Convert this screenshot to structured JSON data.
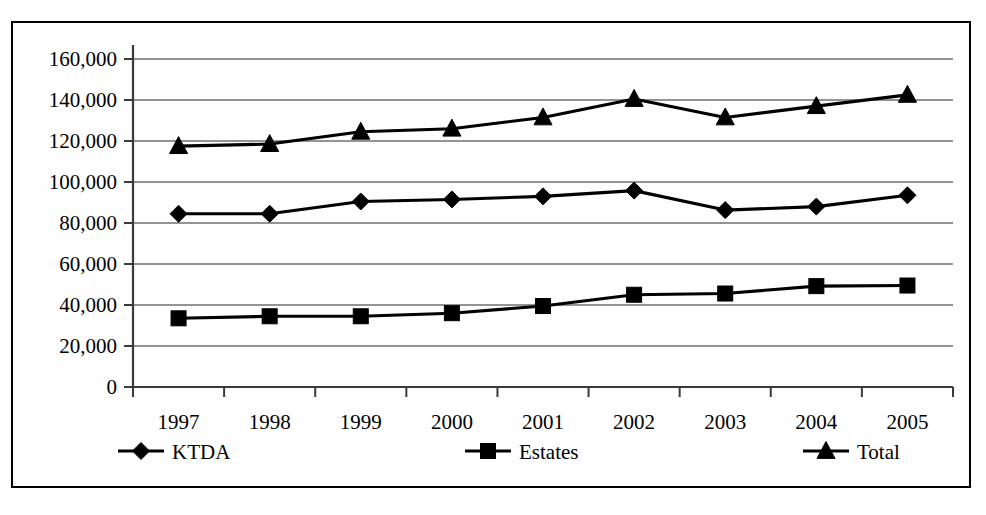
{
  "chart_data": {
    "type": "line",
    "title": "",
    "xlabel": "",
    "ylabel": "",
    "categories": [
      "1997",
      "1998",
      "1999",
      "2000",
      "2001",
      "2002",
      "2003",
      "2004",
      "2005"
    ],
    "ylim": [
      0,
      160000
    ],
    "ytick_values": [
      0,
      20000,
      40000,
      60000,
      80000,
      100000,
      120000,
      140000,
      160000
    ],
    "ytick_labels": [
      "0",
      "20,000",
      "40,000",
      "60,000",
      "80,000",
      "100,000",
      "120,000",
      "140,000",
      "160,000"
    ],
    "grid": true,
    "legend_position": "bottom",
    "series": [
      {
        "name": "KTDA",
        "marker": "diamond",
        "color": "#000000",
        "values": [
          84500,
          84500,
          90500,
          91500,
          93000,
          95800,
          86300,
          88000,
          93500
        ]
      },
      {
        "name": "Estates",
        "marker": "square",
        "color": "#000000",
        "values": [
          33500,
          34500,
          34500,
          36000,
          39500,
          45000,
          45600,
          49200,
          49500
        ]
      },
      {
        "name": "Total",
        "marker": "triangle",
        "color": "#000000",
        "values": [
          117500,
          118500,
          124500,
          126000,
          131500,
          140500,
          131500,
          137000,
          142500
        ]
      }
    ]
  },
  "legend": {
    "items": [
      {
        "label": "KTDA",
        "marker": "diamond"
      },
      {
        "label": "Estates",
        "marker": "square"
      },
      {
        "label": "Total",
        "marker": "triangle"
      }
    ]
  },
  "colors": {
    "ink": "#000000",
    "grid": "#2b2b2b",
    "background": "#ffffff"
  }
}
